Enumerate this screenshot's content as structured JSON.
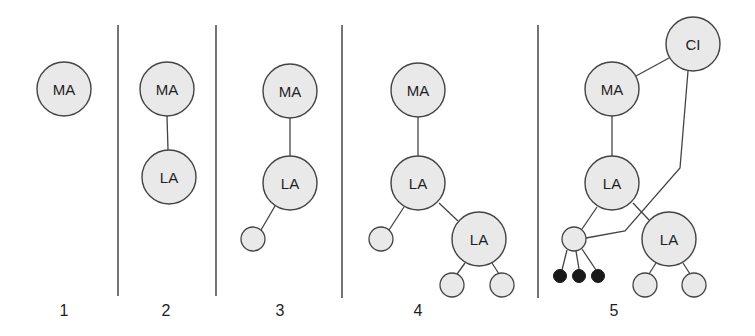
{
  "diagram": {
    "colors": {
      "node_fill": "#e9e9e9",
      "stroke": "#444444",
      "filled_dot": "#1a1a1a",
      "background": "#ffffff"
    },
    "node_labels": {
      "ma": "MA",
      "la": "LA",
      "ci": "CI"
    },
    "panels": [
      {
        "step": "1",
        "nodes": [
          "MA"
        ]
      },
      {
        "step": "2",
        "nodes": [
          "MA",
          "LA"
        ]
      },
      {
        "step": "3",
        "nodes": [
          "MA",
          "LA",
          "leaf"
        ]
      },
      {
        "step": "4",
        "nodes": [
          "MA",
          "LA",
          "leaf",
          "LA",
          "leaf",
          "leaf"
        ]
      },
      {
        "step": "5",
        "nodes": [
          "CI",
          "MA",
          "LA",
          "hub-leaf",
          "LA",
          "leaf",
          "leaf",
          "filled-dot",
          "filled-dot",
          "filled-dot"
        ]
      }
    ],
    "step_labels": [
      "1",
      "2",
      "3",
      "4",
      "5"
    ]
  }
}
